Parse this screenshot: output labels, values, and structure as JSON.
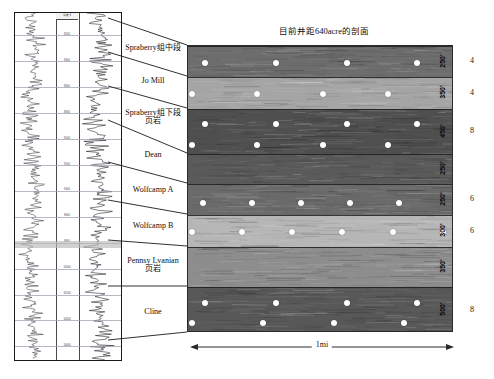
{
  "figure": {
    "title": "目前井距640acre的剖面",
    "scale_label": "1mi"
  },
  "well_log": {
    "header_label": "深度 ft",
    "depth_ticks": [
      "8200",
      "8400",
      "8600",
      "8800",
      "9000",
      "9200",
      "9400",
      "9600",
      "9800",
      "10000",
      "10200",
      "10400",
      "10600"
    ]
  },
  "formations": [
    {
      "name": "Spraberry组中段",
      "name2": "",
      "thickness": "250'",
      "right_num": "4"
    },
    {
      "name": "Jo Mill",
      "name2": "",
      "thickness": "350'",
      "right_num": "4"
    },
    {
      "name": "Spraberry组下段",
      "name2": "页岩",
      "thickness": "450'",
      "right_num": "8"
    },
    {
      "name": "Dean",
      "name2": "",
      "thickness": "250'",
      "right_num": ""
    },
    {
      "name": "Wolfcamp A",
      "name2": "",
      "thickness": "250'",
      "right_num": "6"
    },
    {
      "name": "Wolfcamp B",
      "name2": "",
      "thickness": "300'",
      "right_num": "6"
    },
    {
      "name": "Pennsy Lvanian",
      "name2": "页岩",
      "thickness": "350'",
      "right_num": ""
    },
    {
      "name": "Cline",
      "name2": "",
      "thickness": "500'",
      "right_num": "8"
    }
  ],
  "chart_data": {
    "type": "diagram",
    "title": "目前井距640acre的剖面",
    "subtitle": "Well spacing cross-section, 640 acre",
    "xlabel": "1mi",
    "ylabel": "深度 ft",
    "bands": [
      {
        "name": "Spraberry组中段",
        "thickness_ft": 250,
        "top_px": 0,
        "height_px": 31,
        "fill": "#6d6d6d",
        "wells": 4
      },
      {
        "name": "Jo Mill",
        "thickness_ft": 350,
        "top_px": 31,
        "height_px": 32,
        "fill": "#a5a5a5",
        "wells": 5
      },
      {
        "name": "Spraberry组下段页岩",
        "thickness_ft": 450,
        "top_px": 63,
        "height_px": 45,
        "fill": "#4f4f4f",
        "wells": 9
      },
      {
        "name": "Dean",
        "thickness_ft": 250,
        "top_px": 108,
        "height_px": 30,
        "fill": "#5a5a5a",
        "wells": 0
      },
      {
        "name": "Wolfcamp A",
        "thickness_ft": 250,
        "top_px": 138,
        "height_px": 31,
        "fill": "#6a6a6a",
        "wells": 6
      },
      {
        "name": "Wolfcamp B",
        "thickness_ft": 300,
        "top_px": 169,
        "height_px": 32,
        "fill": "#b6b6b6",
        "wells": 6
      },
      {
        "name": "Pennsy Lvanian页岩",
        "thickness_ft": 350,
        "top_px": 201,
        "height_px": 40,
        "fill": "#8d8d8d",
        "wells": 0
      },
      {
        "name": "Cline",
        "thickness_ft": 500,
        "top_px": 241,
        "height_px": 46,
        "fill": "#585858",
        "wells": 8
      }
    ],
    "well_dot_color": "#ffffff",
    "right_numbers": [
      "4",
      "4",
      "8",
      "6",
      "6",
      "8"
    ]
  }
}
